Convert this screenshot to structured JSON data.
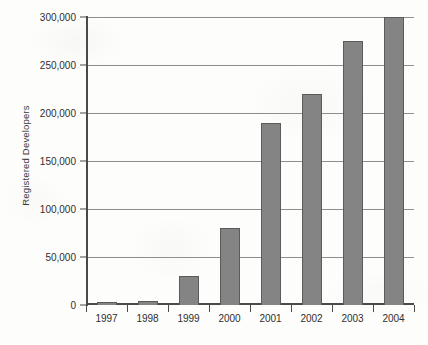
{
  "chart_data": {
    "type": "bar",
    "title": "",
    "xlabel": "",
    "ylabel": "Registered Developers",
    "categories": [
      "1997",
      "1998",
      "1999",
      "2000",
      "2001",
      "2002",
      "2003",
      "2004"
    ],
    "values": [
      3000,
      4500,
      30000,
      80000,
      190000,
      220000,
      275000,
      300000
    ],
    "ylim": [
      0,
      300000
    ],
    "ytick_values": [
      0,
      50000,
      100000,
      150000,
      200000,
      250000,
      300000
    ],
    "ytick_labels": [
      "0",
      "50,000",
      "100,000",
      "150,000",
      "200,000",
      "250,000",
      "300,000"
    ],
    "grid": true,
    "legend": null,
    "series": [
      {
        "name": "Registered Developers",
        "values": [
          3000,
          4500,
          30000,
          80000,
          190000,
          220000,
          275000,
          300000
        ]
      }
    ],
    "colors": {
      "bar_fill": "#848484",
      "bar_outline": "#5b5b5b",
      "gridline": "#8e8e8e",
      "axis": "#4a4a4a",
      "text": "#2f2f2f",
      "background": "#fdfdfc"
    }
  }
}
